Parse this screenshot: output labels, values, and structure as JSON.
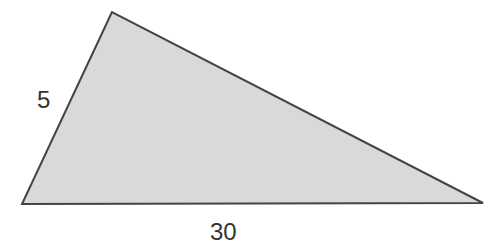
{
  "figure": {
    "shape": "triangle",
    "fill": "#d9d9d9",
    "stroke": "#444444",
    "vertices": {
      "top": [
        112,
        12
      ],
      "bottom_left": [
        22,
        204
      ],
      "bottom_right": [
        483,
        203
      ]
    },
    "labels": {
      "left_side": "5",
      "bottom_side": "30"
    }
  }
}
